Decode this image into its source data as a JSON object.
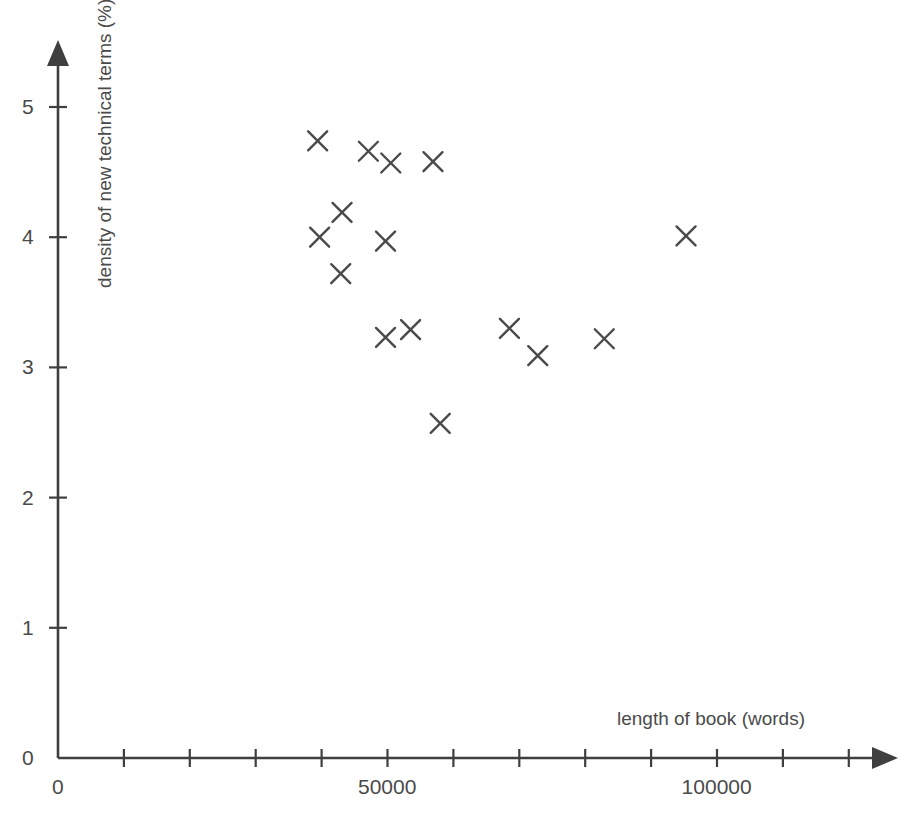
{
  "chart_data": {
    "type": "scatter",
    "title": "",
    "xlabel": "length of book (words)",
    "ylabel": "density of new technical terms (%)",
    "xlim": [
      0,
      127000
    ],
    "ylim": [
      0,
      5.5
    ],
    "grid": false,
    "legend": false,
    "marker": "x",
    "marker_color": "#4a4a4a",
    "axis_color": "#3f3f3f",
    "xticks": [
      0,
      10000,
      20000,
      30000,
      40000,
      50000,
      60000,
      70000,
      80000,
      90000,
      100000,
      110000,
      120000
    ],
    "xtick_labels_shown": [
      {
        "value": 0,
        "label": "0"
      },
      {
        "value": 50000,
        "label": "50000"
      },
      {
        "value": 100000,
        "label": "100000"
      }
    ],
    "yticks": [
      0,
      1,
      2,
      3,
      4,
      5
    ],
    "ytick_labels_shown": [
      {
        "value": 0,
        "label": "0"
      },
      {
        "value": 1,
        "label": "1"
      },
      {
        "value": 2,
        "label": "2"
      },
      {
        "value": 3,
        "label": "3"
      },
      {
        "value": 4,
        "label": "4"
      },
      {
        "value": 5,
        "label": "5"
      }
    ],
    "points": [
      {
        "x": 39400,
        "y": 4.74
      },
      {
        "x": 47100,
        "y": 4.66
      },
      {
        "x": 50500,
        "y": 4.57
      },
      {
        "x": 56900,
        "y": 4.58
      },
      {
        "x": 43100,
        "y": 4.19
      },
      {
        "x": 39700,
        "y": 4.0
      },
      {
        "x": 49700,
        "y": 3.97
      },
      {
        "x": 42900,
        "y": 3.72
      },
      {
        "x": 95300,
        "y": 4.01
      },
      {
        "x": 49700,
        "y": 3.23
      },
      {
        "x": 53500,
        "y": 3.29
      },
      {
        "x": 68500,
        "y": 3.3
      },
      {
        "x": 72800,
        "y": 3.09
      },
      {
        "x": 82900,
        "y": 3.22
      },
      {
        "x": 58000,
        "y": 2.57
      }
    ],
    "n_points": 15
  }
}
